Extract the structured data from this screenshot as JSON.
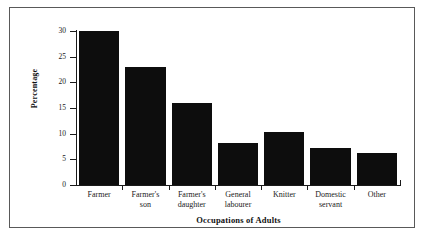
{
  "chart_data": {
    "type": "bar",
    "title": "",
    "xlabel": "Occupations of Adults",
    "ylabel": "Percentage",
    "categories": [
      "Farmer",
      "Farmer's son",
      "Farmer's daughter",
      "General labourer",
      "Knitter",
      "Domestic servant",
      "Other"
    ],
    "category_lines": [
      [
        "Farmer"
      ],
      [
        "Farmer's",
        "son"
      ],
      [
        "Farmer's",
        "daughter"
      ],
      [
        "General",
        "labourer"
      ],
      [
        "Knitter"
      ],
      [
        "Domestic",
        "servant"
      ],
      [
        "Other"
      ]
    ],
    "values": [
      30,
      23,
      16,
      8.2,
      10.3,
      7.2,
      6.3
    ],
    "ylim": [
      0,
      30
    ],
    "yticks": [
      0,
      5,
      10,
      15,
      20,
      25,
      30
    ],
    "ytick_labels": [
      "0",
      "5",
      "10",
      "15",
      "20",
      "25",
      "30"
    ],
    "grid": false,
    "legend": null,
    "bar_color": "#0d0d0d",
    "axis_color": "#1a1a1a",
    "frame_color": "#595959",
    "background": "#ffffff"
  }
}
